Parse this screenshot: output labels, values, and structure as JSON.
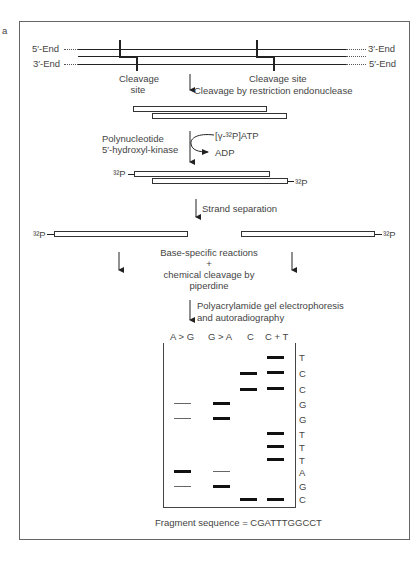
{
  "panel_label": "a",
  "duplex": {
    "top_left": "5′-End",
    "top_right": "3′-End",
    "bottom_left": "3′-End",
    "bottom_right": "5′-End",
    "cleavage_site_left": "Cleavage site",
    "cleavage_site_right": "Cleavage site"
  },
  "steps": {
    "restriction": "Cleavage by restriction endonuclease",
    "kinase_enzyme_line1": "Polynucleotide",
    "kinase_enzyme_line2": "5′-hydroxyl-kinase",
    "kinase_substrate": "[γ-³²P]ATP",
    "kinase_product": "ADP",
    "label_left": "³²P",
    "label_right": "³²P",
    "strand_separation": "Strand separation",
    "strand_label_left": "³²P",
    "strand_label_right": "³²P",
    "reaction_line1": "Base-specific reactions",
    "reaction_line2": "+",
    "reaction_line3": "chemical cleavage by",
    "reaction_line4": "piperdine",
    "electrophoresis_line1": "Polyacrylamide gel electrophoresis",
    "electrophoresis_line2": "and autoradiography"
  },
  "gel": {
    "lanes": [
      "A > G",
      "G > A",
      "C",
      "C + T"
    ],
    "sequence_labels": [
      "T",
      "C",
      "C",
      "G",
      "G",
      "T",
      "T",
      "T",
      "A",
      "G",
      "C"
    ],
    "fragment_sequence": "Fragment sequence = CGATTTGGCCT"
  }
}
